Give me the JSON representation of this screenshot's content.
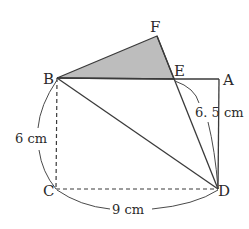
{
  "diagram": {
    "type": "geometry-folded-rectangle",
    "points": {
      "A": {
        "label": "A",
        "x": 219,
        "y": 79
      },
      "B": {
        "label": "B",
        "x": 57,
        "y": 78
      },
      "C": {
        "label": "C",
        "x": 56,
        "y": 189
      },
      "D": {
        "label": "D",
        "x": 218,
        "y": 189
      },
      "E": {
        "label": "E",
        "x": 174,
        "y": 79
      },
      "F": {
        "label": "F",
        "x": 157,
        "y": 36
      }
    },
    "measurements": {
      "BC": "6 cm",
      "CD": "9 cm",
      "ED": "6. 5 cm"
    },
    "shaded_region": "triangle BFE",
    "colors": {
      "line": "#3a3a3a",
      "shade": "#bdbdbd",
      "text": "#2a2a2a"
    }
  }
}
